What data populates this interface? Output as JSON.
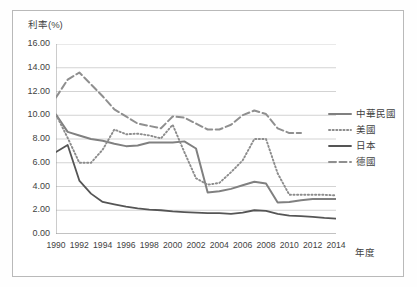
{
  "figure": {
    "y_axis_title": "利率(%)",
    "x_axis_title": "年度"
  },
  "legend": {
    "items": [
      {
        "label": "中華民國",
        "style": "solid-medium",
        "color": "#808080"
      },
      {
        "label": "美國",
        "style": "dotted",
        "color": "#8c8c8c"
      },
      {
        "label": "日本",
        "style": "solid-dark",
        "color": "#555555"
      },
      {
        "label": "德國",
        "style": "dashed",
        "color": "#8f8f8f"
      }
    ]
  },
  "chart_data": {
    "type": "line",
    "title": "",
    "subtitle": "",
    "xlabel": "年度",
    "ylabel": "利率(%)",
    "grid": true,
    "legend_position": "right",
    "xlim": [
      1990,
      2014
    ],
    "ylim": [
      0.0,
      16.0
    ],
    "ytick_step": 2.0,
    "ytick_labels": [
      "0.00",
      "2.00",
      "4.00",
      "6.00",
      "8.00",
      "10.00",
      "12.00",
      "14.00",
      "16.00"
    ],
    "ytick_values": [
      0.0,
      2.0,
      4.0,
      6.0,
      8.0,
      10.0,
      12.0,
      14.0,
      16.0
    ],
    "xtick_labels": [
      "1990",
      "1992",
      "1994",
      "1996",
      "1998",
      "2000",
      "2002",
      "2004",
      "2006",
      "2008",
      "2010",
      "2012",
      "2014"
    ],
    "xtick_values": [
      1990,
      1992,
      1994,
      1996,
      1998,
      2000,
      2002,
      2004,
      2006,
      2008,
      2010,
      2012,
      2014
    ],
    "x": [
      1990,
      1991,
      1992,
      1993,
      1994,
      1995,
      1996,
      1997,
      1998,
      1999,
      2000,
      2001,
      2002,
      2003,
      2004,
      2005,
      2006,
      2007,
      2008,
      2009,
      2010,
      2011,
      2012,
      2013,
      2014
    ],
    "series": [
      {
        "name": "中華民國",
        "color": "#808080",
        "style": "solid-medium",
        "values": [
          10.05,
          8.6,
          8.3,
          8.0,
          7.85,
          7.6,
          7.4,
          7.45,
          7.7,
          7.7,
          7.7,
          7.8,
          7.2,
          3.5,
          3.6,
          3.8,
          4.1,
          4.4,
          4.25,
          2.65,
          2.7,
          2.85,
          2.95,
          2.95,
          2.95
        ]
      },
      {
        "name": "美國",
        "color": "#8c8c8c",
        "style": "dotted",
        "values": [
          10.05,
          8.1,
          6.0,
          6.0,
          7.1,
          8.8,
          8.4,
          8.45,
          8.3,
          8.05,
          9.2,
          6.9,
          4.7,
          4.15,
          4.3,
          5.2,
          6.2,
          8.0,
          8.0,
          5.1,
          3.3,
          3.3,
          3.3,
          3.3,
          3.25
        ]
      },
      {
        "name": "日本",
        "color": "#555555",
        "style": "solid-dark",
        "values": [
          6.9,
          7.5,
          4.5,
          3.4,
          2.7,
          2.5,
          2.3,
          2.15,
          2.05,
          2.0,
          1.9,
          1.85,
          1.8,
          1.75,
          1.75,
          1.7,
          1.8,
          2.0,
          1.95,
          1.7,
          1.55,
          1.5,
          1.45,
          1.35,
          1.3
        ]
      },
      {
        "name": "德國",
        "color": "#8f8f8f",
        "style": "dashed",
        "values": [
          11.5,
          13.0,
          13.6,
          12.6,
          11.6,
          10.5,
          9.9,
          9.3,
          9.1,
          8.9,
          9.9,
          9.8,
          9.3,
          8.8,
          8.8,
          9.2,
          10.0,
          10.4,
          10.1,
          8.9,
          8.5,
          8.5,
          null,
          null,
          null
        ]
      }
    ]
  }
}
